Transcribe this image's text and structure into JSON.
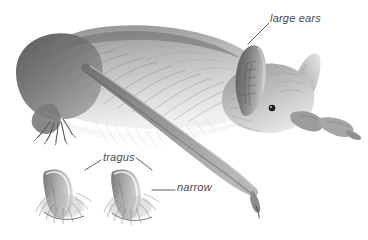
{
  "figure": {
    "background_color": "#ffffff",
    "width": 368,
    "height": 240,
    "style": "grayscale pencil/airbrush scientific illustration"
  },
  "labels": [
    {
      "id": "large-ears",
      "text": "large ears",
      "color": "#4a4a4a",
      "leader_from": [
        248,
        44
      ],
      "leader_to": [
        269,
        23
      ]
    },
    {
      "id": "tragus",
      "text": "tragus",
      "color": "#4a4a4a",
      "leader_left_from": [
        101,
        160
      ],
      "leader_left_to": [
        85,
        170
      ],
      "leader_right_from": [
        136,
        158
      ],
      "leader_right_to": [
        152,
        170
      ]
    },
    {
      "id": "narrow",
      "text": "narrow",
      "color": "#4a4a4a",
      "leader_from": [
        152,
        190
      ],
      "leader_to": [
        175,
        190
      ]
    }
  ],
  "subject": {
    "animal": "bat",
    "parts": [
      "body",
      "rump",
      "hind-foot",
      "head",
      "near-ear",
      "far-ear",
      "eye",
      "snout",
      "forearm",
      "thumb-claw",
      "wing-tip-claw"
    ]
  },
  "insets": [
    {
      "id": "tragus-left",
      "description": "tragus detail, left specimen"
    },
    {
      "id": "tragus-right",
      "description": "tragus detail, right specimen"
    }
  ],
  "palette": {
    "ink_dark": "#3a3a3a",
    "ink_mid": "#7b7b7b",
    "ink_light": "#b9b9b9",
    "ink_pale": "#e2e2e2",
    "label": "#4a4a4a",
    "background": "#ffffff"
  }
}
